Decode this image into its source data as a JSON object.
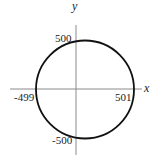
{
  "diagram": {
    "type": "circle-on-axes",
    "axes": {
      "x_label": "x",
      "y_label": "y"
    },
    "annotations": {
      "top": "500",
      "left": "-499",
      "right": "501",
      "bottom": "-500"
    },
    "colors": {
      "curve": "#111111",
      "axes": "#888888",
      "text": "#222222"
    }
  }
}
